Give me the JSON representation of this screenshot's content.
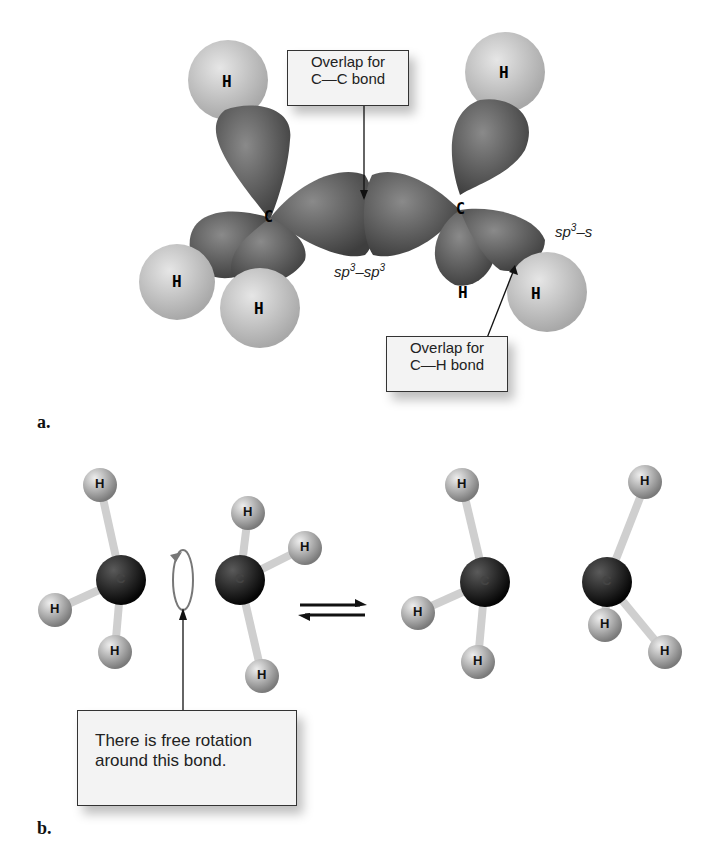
{
  "figure": {
    "panel_a": {
      "label": "a.",
      "callout_cc": {
        "line1": "Overlap for",
        "line2": "C—C bond"
      },
      "callout_ch": {
        "line1": "Overlap for",
        "line2": "C—H bond"
      },
      "orbital_sp3sp3": {
        "a": "sp",
        "a_exp": "3",
        "dash": "–",
        "b": "sp",
        "b_exp": "3"
      },
      "orbital_sp3s": {
        "a": "sp",
        "a_exp": "3",
        "dash": "–",
        "b": "s"
      },
      "atoms": {
        "carbon": "C",
        "hydrogen": "H"
      }
    },
    "panel_b": {
      "label": "b.",
      "callout_rotation": {
        "line1": "There is free rotation",
        "line2": "around this bond."
      },
      "equilibrium_arrow": "⇌",
      "atoms": {
        "carbon": "C",
        "hydrogen": "H"
      }
    },
    "colors": {
      "lobe": "#5a5a5a",
      "hydrogen": "#c8c8c8",
      "carbon": "#1a1a1a",
      "bond": "#d8d8d8",
      "callout_bg": "#f3f3f3"
    }
  }
}
